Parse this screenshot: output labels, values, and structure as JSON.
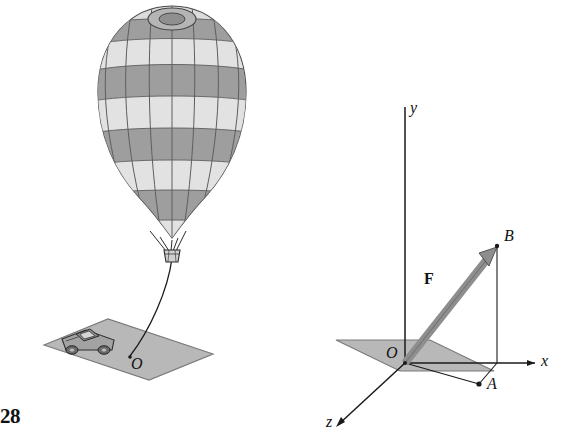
{
  "figure": {
    "problem_number": "28",
    "left_scene": {
      "origin_label": "O",
      "description_labels": {
        "balloon": "hot-air-balloon",
        "vehicle": "pickup-truck",
        "ground": "ground-plane",
        "tether": "tether-cable"
      }
    },
    "right_scene": {
      "axis_y": "y",
      "axis_x": "x",
      "axis_z": "z",
      "origin": "O",
      "point_b": "B",
      "point_a": "A",
      "force_vector": "F"
    }
  },
  "colors": {
    "line": "#1a1a1a",
    "plane_fill": "#b9b9b9",
    "plane_stroke": "#6f6f6f",
    "balloon_dark": "#8c8c8c",
    "balloon_light": "#d8d8d8",
    "balloon_mid": "#a8a8a8",
    "vector_fill": "#8e8e8e",
    "vector_stroke": "#3a3a3a",
    "truck_body": "#9a9a9a",
    "truck_dark": "#6a6a6a",
    "basket": "#cfcfcf"
  }
}
